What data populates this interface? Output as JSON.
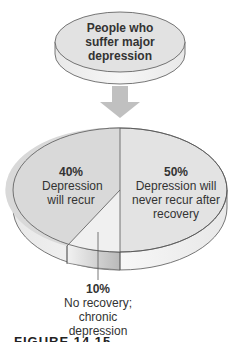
{
  "top_disc": {
    "label": "People who suffer major depression"
  },
  "pie": {
    "slices": [
      {
        "percent": "40%",
        "label": "Depression will recur",
        "value": 40,
        "color": "#d9d9d9"
      },
      {
        "percent": "50%",
        "label": "Depression will never recur after recovery",
        "value": 50,
        "color": "#e3e3e3"
      },
      {
        "percent": "10%",
        "label": "No recovery; chronic depression",
        "value": 10,
        "color": "#ededed"
      }
    ]
  },
  "colors": {
    "disc_top": "#e2e2e2",
    "disc_side": "#f2f2f2",
    "arrow": "#bdbdbd",
    "outline": "#555555",
    "chronic_side": "#bcbcbc"
  },
  "caption": {
    "text": "FIGURE 14.15"
  }
}
